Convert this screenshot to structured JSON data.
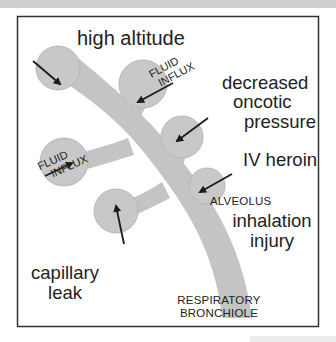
{
  "diagram": {
    "title": "high altitude",
    "causes": {
      "decreased_oncotic": [
        "decreased",
        "oncotic",
        "pressure"
      ],
      "iv_heroin": "IV heroin",
      "inhalation_injury": [
        "inhalation",
        "injury"
      ],
      "capillary_leak": [
        "capillary",
        "leak"
      ]
    },
    "labels": {
      "fluid_influx_top": [
        "FLUID",
        "INFLUX"
      ],
      "fluid_influx_left": [
        "FLUID",
        "INFLUX"
      ],
      "alveolus": "ALVEOLUS",
      "bronchiole": [
        "RESPIRATORY",
        "BRONCHIOLE"
      ]
    },
    "colors": {
      "alveolus_fill": "#c8c8c8",
      "alveolus_edge": "#b4b4b4",
      "airway_fill": "#c4c4c4",
      "arrow": "#1a1a1a",
      "border": "#333333"
    }
  }
}
